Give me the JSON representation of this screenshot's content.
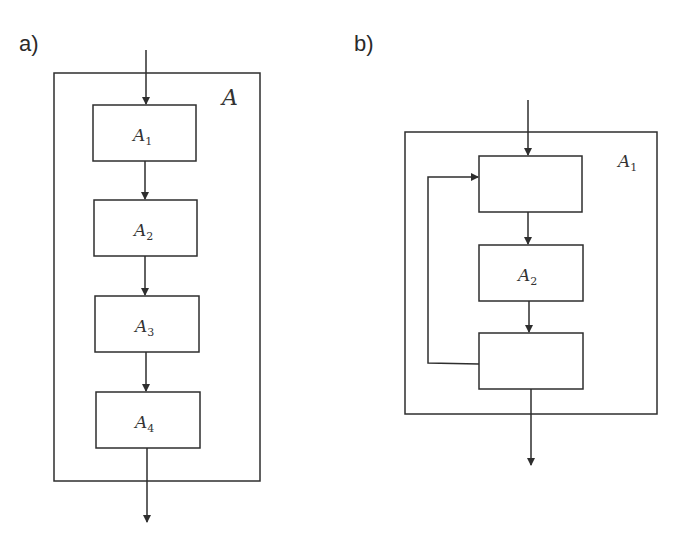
{
  "panel_a": {
    "label": "a)",
    "container_label": "A",
    "blocks": [
      {
        "name": "A",
        "sub": "1"
      },
      {
        "name": "A",
        "sub": "2"
      },
      {
        "name": "A",
        "sub": "3"
      },
      {
        "name": "A",
        "sub": "4"
      }
    ]
  },
  "panel_b": {
    "label": "b)",
    "container_label": "A",
    "container_sub": "1",
    "blocks": [
      {
        "name": "",
        "sub": ""
      },
      {
        "name": "A",
        "sub": "2"
      },
      {
        "name": "",
        "sub": ""
      }
    ],
    "feedback": "loop from bottom block back to top block"
  },
  "colors": {
    "stroke": "#2e2e2e",
    "text": "#333333",
    "background": "#ffffff"
  }
}
